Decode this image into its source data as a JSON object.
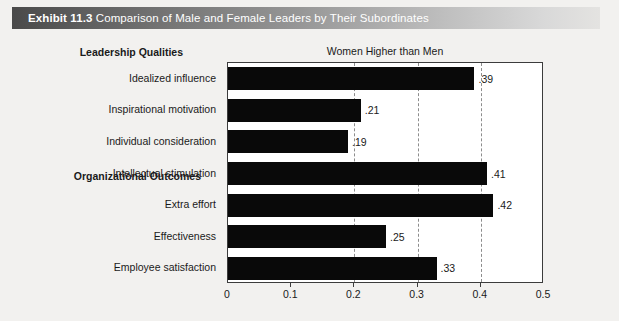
{
  "header": {
    "exhibit_number": "Exhibit 11.3",
    "title": "Comparison of Male and Female Leaders by Their Subordinates"
  },
  "sections": [
    {
      "label": "Leadership Qualities"
    },
    {
      "label": "Organizational Outcomes"
    }
  ],
  "chart_data": {
    "type": "bar",
    "orientation": "horizontal",
    "title": "Women Higher than Men",
    "xlabel": "",
    "ylabel": "",
    "xlim": [
      0,
      0.5
    ],
    "grid": true,
    "gridlines": [
      0.2,
      0.3,
      0.4
    ],
    "tick_labels": [
      "0",
      "0.1",
      "0.2",
      "0.3",
      "0.4",
      "0.5"
    ],
    "tick_values": [
      0,
      0.1,
      0.2,
      0.3,
      0.4,
      0.5
    ],
    "legend": "none",
    "bar_color": "#090909",
    "categories": [
      "Idealized influence",
      "Inspirational motivation",
      "Individual consideration",
      "Intellectual stimulation",
      "Extra effort",
      "Effectiveness",
      "Employee satisfaction"
    ],
    "values": [
      0.39,
      0.21,
      0.19,
      0.41,
      0.42,
      0.25,
      0.33
    ],
    "value_labels": [
      ".39",
      ".21",
      ".19",
      ".41",
      ".42",
      ".25",
      ".33"
    ],
    "groups": [
      {
        "name": "Leadership Qualities",
        "categories": [
          "Idealized influence",
          "Inspirational motivation",
          "Individual consideration",
          "Intellectual stimulation"
        ]
      },
      {
        "name": "Organizational Outcomes",
        "categories": [
          "Extra effort",
          "Effectiveness",
          "Employee satisfaction"
        ]
      }
    ]
  }
}
